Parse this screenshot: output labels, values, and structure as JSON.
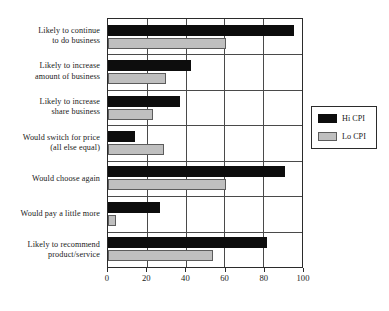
{
  "chart_data": {
    "type": "bar",
    "orientation": "horizontal",
    "title": "",
    "xlabel": "",
    "ylabel": "",
    "xlim": [
      0,
      100
    ],
    "xticks": [
      0,
      20,
      40,
      60,
      80,
      100
    ],
    "xtick_labels": [
      "0",
      "20",
      "40",
      "60",
      "80",
      "100"
    ],
    "grid": true,
    "legend_position": "right",
    "categories": [
      "Likely to continue to do business",
      "Likely to increase amount of business",
      "Likely to increase share business",
      "Would switch for price (all else equal)",
      "Would choose again",
      "Would pay a little more",
      "Likely to recommend product/service"
    ],
    "category_lines": [
      [
        "Likely to continue",
        "to do business"
      ],
      [
        "Likely to increase",
        "amount of business"
      ],
      [
        "Likely to increase",
        "share business"
      ],
      [
        "Would switch for price",
        "(all else equal)"
      ],
      [
        "Would choose again"
      ],
      [
        "Would pay a little more"
      ],
      [
        "Likely to recommend",
        "product/service"
      ]
    ],
    "series": [
      {
        "name": "Hi CPI",
        "color": "#0d0d0d",
        "values": [
          96,
          43,
          37,
          14,
          91,
          27,
          82
        ]
      },
      {
        "name": "Lo CPI",
        "color": "#bfbfbf",
        "values": [
          61,
          30,
          23,
          29,
          61,
          4,
          54
        ]
      }
    ]
  },
  "legend": {
    "items": [
      {
        "label": "Hi CPI",
        "color": "#0d0d0d"
      },
      {
        "label": "Lo CPI",
        "color": "#bfbfbf"
      }
    ]
  },
  "colors": {
    "hi_cpi": "#0d0d0d",
    "lo_cpi": "#bfbfbf",
    "axis": "#2b2b2b",
    "grid": "#4a4a4a",
    "background": "#ffffff"
  }
}
